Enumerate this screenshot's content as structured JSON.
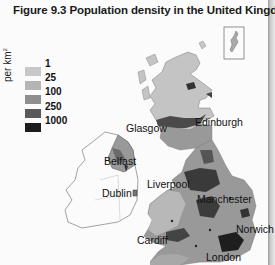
{
  "figure": {
    "title": "Figure 9.3 Population density in the United Kingdom"
  },
  "legend": {
    "unit": "per km",
    "unit_exponent": "2",
    "items": [
      {
        "label": "1",
        "color": "#c8c8c8"
      },
      {
        "label": "25",
        "color": "#b4b4b4"
      },
      {
        "label": "100",
        "color": "#8e8e8e"
      },
      {
        "label": "250",
        "color": "#5a5a5a"
      },
      {
        "label": "1000",
        "color": "#1c1c1c"
      }
    ]
  },
  "cities": [
    {
      "name": "Glasgow"
    },
    {
      "name": "Edinburgh"
    },
    {
      "name": "Belfast"
    },
    {
      "name": "Dublin"
    },
    {
      "name": "Liverpool"
    },
    {
      "name": "Manchester"
    },
    {
      "name": "Norwich"
    },
    {
      "name": "Cardiff"
    },
    {
      "name": "London"
    }
  ],
  "inset": {
    "label": "Shetland inset"
  }
}
